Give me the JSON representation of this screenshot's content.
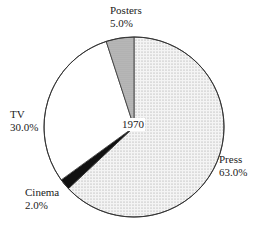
{
  "chart_data": {
    "type": "pie",
    "title": "1970",
    "start_angle": "12 o'clock",
    "direction": "clockwise",
    "slices": [
      {
        "label": "Press",
        "value": 63.0,
        "display": "63.0%",
        "fill": "dotted-light-gray"
      },
      {
        "label": "Cinema",
        "value": 2.0,
        "display": "2.0%",
        "fill": "black"
      },
      {
        "label": "TV",
        "value": 30.0,
        "display": "30.0%",
        "fill": "white"
      },
      {
        "label": "Posters",
        "value": 5.0,
        "display": "5.0%",
        "fill": "medium-gray"
      }
    ],
    "legend": "none (direct labels)"
  },
  "center_label": "1970",
  "labels": {
    "press": {
      "name": "Press",
      "pct": "63.0%"
    },
    "cinema": {
      "name": "Cinema",
      "pct": "2.0%"
    },
    "tv": {
      "name": "TV",
      "pct": "30.0%"
    },
    "posters": {
      "name": "Posters",
      "pct": "5.0%"
    }
  },
  "colors": {
    "press": "#ececec",
    "cinema": "#111111",
    "tv": "#ffffff",
    "posters": "#b4b4b4",
    "outline": "#333333"
  }
}
